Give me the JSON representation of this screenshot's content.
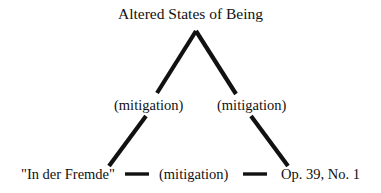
{
  "diagram": {
    "title": "Altered States of Being",
    "type": "hierarchical-tree",
    "nodes": {
      "root": "Altered States of Being",
      "mid_left": "(mitigation)",
      "mid_right": "(mitigation)",
      "leaf_left": "\"In der Fremde\"",
      "leaf_center": "(mitigation)",
      "leaf_right": "Op. 39, No. 1"
    },
    "colors": {
      "stroke": "#111111",
      "text": "#111111",
      "background": "#ffffff"
    },
    "edges": [
      {
        "name": "root-to-mid-left",
        "x1": 196,
        "y1": 31,
        "x2": 157,
        "y2": 93
      },
      {
        "name": "root-to-mid-right",
        "x1": 196,
        "y1": 31,
        "x2": 236,
        "y2": 94
      },
      {
        "name": "mid-left-to-leaf-left",
        "x1": 146,
        "y1": 116,
        "x2": 109,
        "y2": 166
      },
      {
        "name": "mid-right-to-leaf-right",
        "x1": 251,
        "y1": 116,
        "x2": 288,
        "y2": 166
      },
      {
        "name": "leaf-left-to-leaf-center",
        "x1": 125,
        "y1": 174,
        "x2": 149,
        "y2": 174
      },
      {
        "name": "leaf-center-to-leaf-right",
        "x1": 243,
        "y1": 174,
        "x2": 267,
        "y2": 174
      }
    ]
  }
}
